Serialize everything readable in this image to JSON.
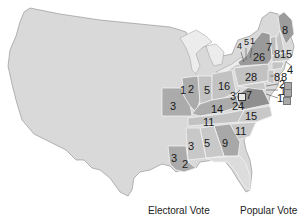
{
  "map": {
    "title": "",
    "colors": {
      "territory": "#d9d9d9",
      "light_state": "#c4c4c4",
      "medium_state": "#aaaaaa",
      "dark_state": "#8f8f8f",
      "border": "#f4f4f4",
      "lake": "#e6e6e6"
    },
    "state_labels": [
      {
        "id": "maine",
        "value": "8"
      },
      {
        "id": "new-hampshire",
        "value": "8"
      },
      {
        "id": "vermont",
        "value": "7"
      },
      {
        "id": "massachusetts",
        "value": "15"
      },
      {
        "id": "rhode-island",
        "value": "4"
      },
      {
        "id": "connecticut",
        "value": "8"
      },
      {
        "id": "new-york",
        "value": "26"
      },
      {
        "id": "new-york-split-1",
        "value": "4"
      },
      {
        "id": "new-york-split-2",
        "value": "5"
      },
      {
        "id": "new-york-split-3",
        "value": "1"
      },
      {
        "id": "new-jersey",
        "value": "8"
      },
      {
        "id": "pennsylvania",
        "value": "28"
      },
      {
        "id": "delaware",
        "value": "2"
      },
      {
        "id": "maryland-1",
        "value": "1"
      },
      {
        "id": "maryland-2",
        "value": "1"
      },
      {
        "id": "maryland-3",
        "value": "3"
      },
      {
        "id": "maryland-4",
        "value": "7"
      },
      {
        "id": "virginia",
        "value": "24"
      },
      {
        "id": "north-carolina",
        "value": "15"
      },
      {
        "id": "south-carolina",
        "value": "11"
      },
      {
        "id": "georgia",
        "value": "9"
      },
      {
        "id": "alabama",
        "value": "5"
      },
      {
        "id": "mississippi",
        "value": "3"
      },
      {
        "id": "louisiana",
        "value": "2"
      },
      {
        "id": "louisiana-west",
        "value": "3"
      },
      {
        "id": "tennessee",
        "value": "11"
      },
      {
        "id": "kentucky",
        "value": "14"
      },
      {
        "id": "ohio",
        "value": "16"
      },
      {
        "id": "indiana",
        "value": "5"
      },
      {
        "id": "illinois",
        "value": "2"
      },
      {
        "id": "illinois-split",
        "value": "1"
      },
      {
        "id": "missouri",
        "value": "3"
      }
    ]
  },
  "legend": {
    "electoral_vote_label": "Electoral Vote",
    "popular_vote_label": "Popular Vote"
  }
}
